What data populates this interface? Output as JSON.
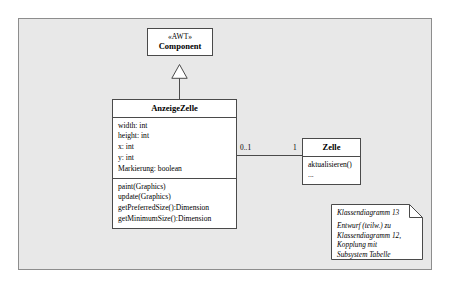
{
  "diagram": {
    "classes": [
      {
        "id": "component",
        "stereotype": "«AWT»",
        "name": "Component",
        "attributes": [],
        "operations": []
      },
      {
        "id": "anzeigezelle",
        "stereotype": "",
        "name": "AnzeigeZelle",
        "attributes": [
          "width: int",
          "height: int",
          "x: int",
          "y: int",
          "Markierung: boolean"
        ],
        "operations": [
          "paint(Graphics)",
          "update(Graphics)",
          "getPreferredSize():Dimension",
          "getMinimumSize():Dimension"
        ]
      },
      {
        "id": "zelle",
        "stereotype": "",
        "name": "Zelle",
        "attributes": [],
        "operations": [
          "aktualisieren()",
          "..."
        ]
      }
    ],
    "relations": {
      "generalization": {
        "from": "anzeigezelle",
        "to": "component",
        "arrow": "hollow-triangle"
      },
      "association": {
        "from": "anzeigezelle",
        "to": "zelle",
        "source_multiplicity": "0..1",
        "target_multiplicity": "1"
      }
    },
    "note": {
      "title": "Klassendiagramm 13",
      "lines": [
        "Entwurf (teilw.) zu",
        "Klassendiagramm 12,",
        "Kopplung mit",
        "Subsystem Tabelle"
      ]
    },
    "colors": {
      "panel_background": "#e8e8e8",
      "panel_border": "#8d8d8d",
      "box_background": "#ffffff",
      "box_border": "#4a4a4a",
      "line": "#4a4a4a",
      "text": "#000000",
      "page_background": "#ffffff"
    }
  }
}
